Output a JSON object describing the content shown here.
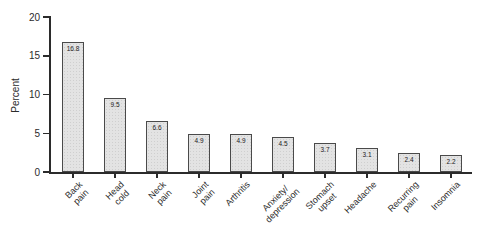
{
  "chart_data": {
    "type": "bar",
    "title": "",
    "xlabel": "",
    "ylabel": "Percent",
    "categories": [
      "Back\npain",
      "Head\ncold",
      "Neck\npain",
      "Joint\npain",
      "Arthritis",
      "Anxiety/\ndepression",
      "Stomach\nupset",
      "Headache",
      "Recurring\npain",
      "Insomnia"
    ],
    "values": [
      16.8,
      9.5,
      6.6,
      4.9,
      4.9,
      4.5,
      3.7,
      3.1,
      2.4,
      2.2
    ],
    "value_labels": [
      "16.8",
      "9.5",
      "6.6",
      "4.9",
      "4.9",
      "4.5",
      "3.7",
      "3.1",
      "2.4",
      "2.2"
    ],
    "ylim": [
      0,
      20
    ],
    "yticks": [
      "0",
      "5",
      "10",
      "15",
      "20"
    ],
    "grid": "off",
    "legend": "none",
    "bar_fill_color": "#e3e3e3",
    "bar_border_color": "#4a4a4a",
    "axis_color": "#2b2b2b",
    "background_color": "#ffffff"
  }
}
